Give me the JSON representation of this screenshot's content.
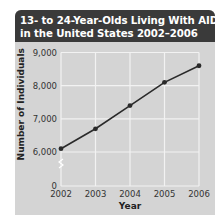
{
  "title_line1": "13- to 24-Year-Olds Living With AIDS",
  "title_line2": "in the United States 2002–2006",
  "colors": {
    "title_bg": "#3a3a3a",
    "plot_bg": "#d4d4d4",
    "grid": "#f2f2f2",
    "line": "#2a2a2a"
  },
  "chart_data": {
    "type": "line",
    "title": "13- to 24-Year-Olds Living With AIDS in the United States 2002–2006",
    "xlabel": "Year",
    "ylabel": "Number of Individuals",
    "categories": [
      "2002",
      "2003",
      "2004",
      "2005",
      "2006"
    ],
    "series": [
      {
        "name": "Individuals living with AIDS",
        "values": [
          6100,
          6700,
          7400,
          8100,
          8600
        ]
      }
    ],
    "y_ticks": [
      "0",
      "6,000",
      "7,000",
      "8,000",
      "9,000"
    ],
    "ylim": [
      0,
      9000
    ],
    "y_axis_break": "between 0 and 6,000",
    "grid": true,
    "legend": "none"
  }
}
